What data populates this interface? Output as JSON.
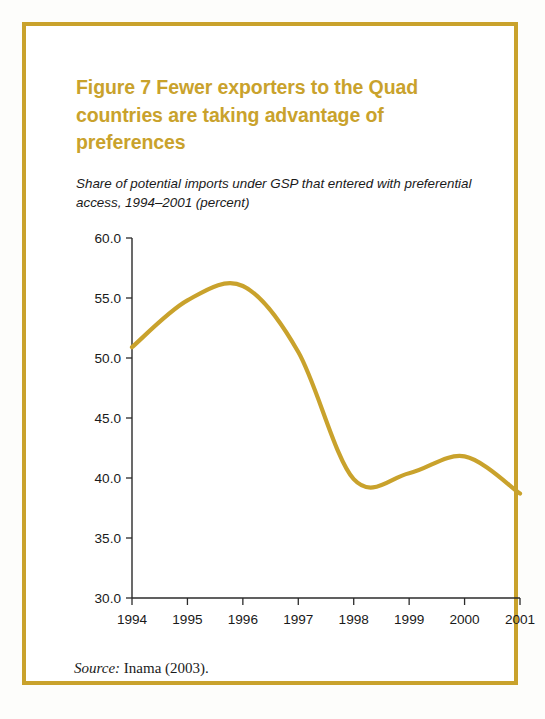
{
  "figure": {
    "title": "Figure 7  Fewer exporters to the Quad countries are taking advantage of preferences",
    "subtitle": "Share of potential imports under GSP that entered with preferential access, 1994–2001 (percent)",
    "source_label": "Source:",
    "source_text": " Inama (2003).",
    "border_color": "#c9a22c",
    "title_color": "#c9a22c",
    "line_color": "#c9a22c"
  },
  "chart_data": {
    "type": "line",
    "title": "Figure 7  Fewer exporters to the Quad countries are taking advantage of preferences",
    "subtitle": "Share of potential imports under GSP that entered with preferential access, 1994–2001 (percent)",
    "xlabel": "",
    "ylabel": "",
    "x": [
      1994,
      1995,
      1996,
      1997,
      1998,
      1999,
      2000,
      2001
    ],
    "x_tick_labels": [
      "1994",
      "1995",
      "1996",
      "1997",
      "1998",
      "1999",
      "2000",
      "2001"
    ],
    "y_tick_labels": [
      "60.0",
      "55.0",
      "50.0",
      "45.0",
      "40.0",
      "35.0",
      "30.0"
    ],
    "y_ticks": [
      60.0,
      55.0,
      50.0,
      45.0,
      40.0,
      35.0,
      30.0
    ],
    "ylim": [
      30.0,
      60.0
    ],
    "xlim": [
      1994,
      2001
    ],
    "grid": false,
    "legend": false,
    "series": [
      {
        "name": "Share of potential imports under GSP entered with preferential access",
        "color": "#c9a22c",
        "values": [
          50.9,
          54.8,
          56.0,
          50.5,
          39.9,
          40.4,
          41.8,
          38.7
        ]
      }
    ],
    "annotations": [
      {
        "label": "peak",
        "x": 1995.5,
        "y": 56.3
      },
      {
        "label": "trough",
        "x": 1998.1,
        "y": 39.8
      },
      {
        "label": "local-peak",
        "x": 1999.9,
        "y": 41.8
      }
    ]
  }
}
